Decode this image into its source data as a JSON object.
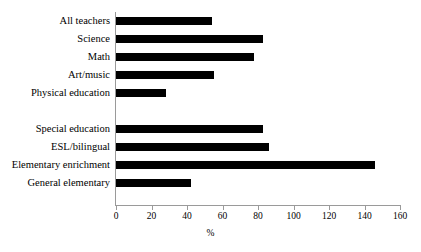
{
  "chart_data": {
    "type": "bar",
    "orientation": "horizontal",
    "title": "",
    "xlabel": "%",
    "ylabel": "",
    "xlim": [
      0,
      160
    ],
    "xticks": [
      0,
      20,
      40,
      60,
      80,
      100,
      120,
      140,
      160
    ],
    "grid": false,
    "legend": null,
    "bar_color": "#000000",
    "axis_color": "#9a9a9a",
    "categories": [
      "All teachers",
      "Science",
      "Math",
      "Art/music",
      "Physical education",
      "",
      "Special education",
      "ESL/bilingual",
      "Elementary enrichment",
      "General elementary"
    ],
    "values": [
      54,
      83,
      78,
      55,
      28,
      null,
      83,
      86,
      146,
      42
    ],
    "rows": [
      {
        "label": "All teachers",
        "value": 54
      },
      {
        "label": "Science",
        "value": 83
      },
      {
        "label": "Math",
        "value": 78
      },
      {
        "label": "Art/music",
        "value": 55
      },
      {
        "label": "Physical education",
        "value": 28
      },
      {
        "label": "",
        "value": null
      },
      {
        "label": "Special education",
        "value": 83
      },
      {
        "label": "ESL/bilingual",
        "value": 86
      },
      {
        "label": "Elementary enrichment",
        "value": 146
      },
      {
        "label": "General elementary",
        "value": 42
      }
    ]
  }
}
